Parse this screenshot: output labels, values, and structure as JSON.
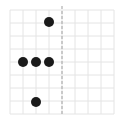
{
  "grid": {
    "x0": 10,
    "y0": 10,
    "cell": 13,
    "cols": 8,
    "rows": 8,
    "line_color": "#e4e4e4",
    "axis_color": "#b0b0b0"
  },
  "symmetry_line": {
    "x": 62,
    "style": "dashed"
  },
  "dots": [
    {
      "x": 49,
      "y": 22
    },
    {
      "x": 23,
      "y": 62
    },
    {
      "x": 36,
      "y": 62
    },
    {
      "x": 49,
      "y": 62
    },
    {
      "x": 36,
      "y": 102
    }
  ],
  "dot_color": "#1a1a1a",
  "dot_radius": 5
}
